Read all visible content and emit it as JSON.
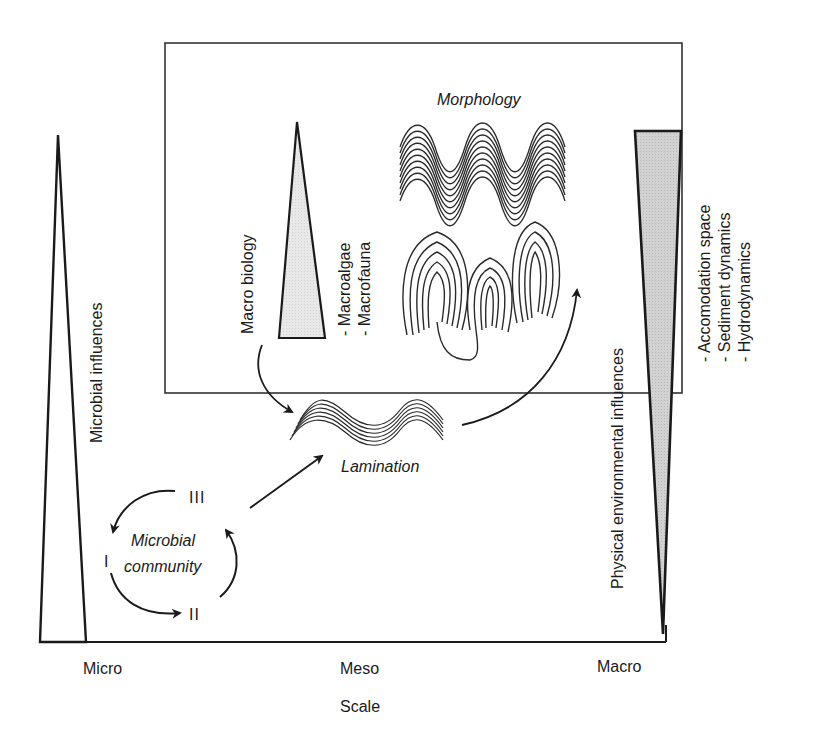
{
  "diagram": {
    "x_axis": {
      "title": "Scale",
      "ticks": [
        "Micro",
        "Meso",
        "Macro"
      ]
    },
    "left_wedge": {
      "label": "Microbial influences",
      "fill": "#ffffff"
    },
    "right_wedge": {
      "label": "Physical environmental influences",
      "items": [
        "- Accomodation space",
        "- Sediment dynamics",
        "- Hydrodynamics"
      ],
      "fill": "#cfcfcf"
    },
    "macro_biology": {
      "label": "Macro biology",
      "items": [
        "- Macroalgae",
        "- Macrofauna"
      ],
      "fill": "#e6e6e6"
    },
    "morphology": {
      "label": "Morphology"
    },
    "lamination": {
      "label": "Lamination"
    },
    "microbial_community": {
      "label_line1": "Microbial",
      "label_line2": "community",
      "stages": [
        "I",
        "II",
        "III"
      ]
    },
    "colors": {
      "stroke": "#1a1a1a",
      "box_stroke": "#333333",
      "background": "#ffffff"
    }
  }
}
